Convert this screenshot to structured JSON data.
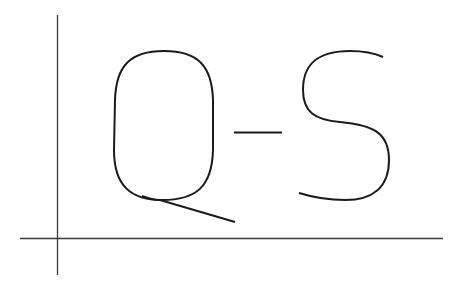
{
  "figure": {
    "text": "Q-S",
    "letters": [
      "Q",
      "-",
      "S"
    ],
    "stroke_color": "#1a1a1a",
    "axis_color": "#3a3a3a",
    "background": "#ffffff"
  }
}
